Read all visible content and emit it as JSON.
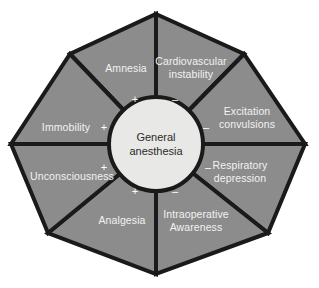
{
  "diagram": {
    "center": {
      "line1": "General",
      "line2": "anesthesia"
    },
    "colors": {
      "background": "#ffffff",
      "segment_fill": "#8c8c8c",
      "segment_stroke": "#1a1a1a",
      "hub_fill": "#e8e8e6",
      "label_text": "#f2f2f2",
      "hub_text": "#2b2b2b",
      "sign_text": "#ffffff"
    },
    "segments": [
      {
        "id": "amnesia",
        "line1": "Amnesia",
        "line2": "",
        "sign": "+",
        "category": "desired-effect"
      },
      {
        "id": "cardiovascular-instability",
        "line1": "Cardiovascular",
        "line2": "instability",
        "sign": "–",
        "category": "adverse-effect"
      },
      {
        "id": "excitation-convulsions",
        "line1": "Excitation",
        "line2": "convulsions",
        "sign": "–",
        "category": "adverse-effect"
      },
      {
        "id": "respiratory-depression",
        "line1": "Respiratory",
        "line2": "depression",
        "sign": "–",
        "category": "adverse-effect"
      },
      {
        "id": "intraoperative-awareness",
        "line1": "Intraoperative",
        "line2": "Awareness",
        "sign": "–",
        "category": "adverse-effect"
      },
      {
        "id": "analgesia",
        "line1": "Analgesia",
        "line2": "",
        "sign": "+",
        "category": "desired-effect"
      },
      {
        "id": "unconsciousness",
        "line1": "Unconsciousness",
        "line2": "",
        "sign": "+",
        "category": "desired-effect"
      },
      {
        "id": "immobility",
        "line1": "Immobility",
        "line2": "",
        "sign": "+",
        "category": "desired-effect"
      }
    ]
  }
}
